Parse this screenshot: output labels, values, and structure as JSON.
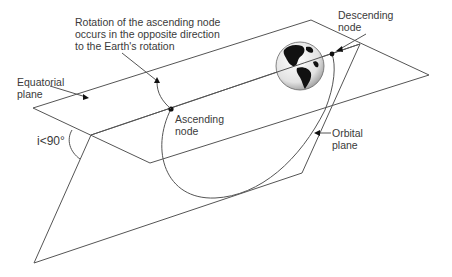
{
  "diagram": {
    "labels": {
      "rotation_note": "Rotation of the ascending node\noccurs in the opposite direction\nto the Earth's rotation",
      "equatorial_plane": "Equatorial\nplane",
      "ascending_node": "Ascending\nnode",
      "descending_node": "Descending\nnode",
      "orbital_plane": "Orbital\nplane",
      "inclination": "i<90°"
    },
    "colors": {
      "line": "#555555",
      "text": "#3a3a3a",
      "earth_land": "#111111",
      "earth_ocean": "#e8e8e8"
    }
  }
}
